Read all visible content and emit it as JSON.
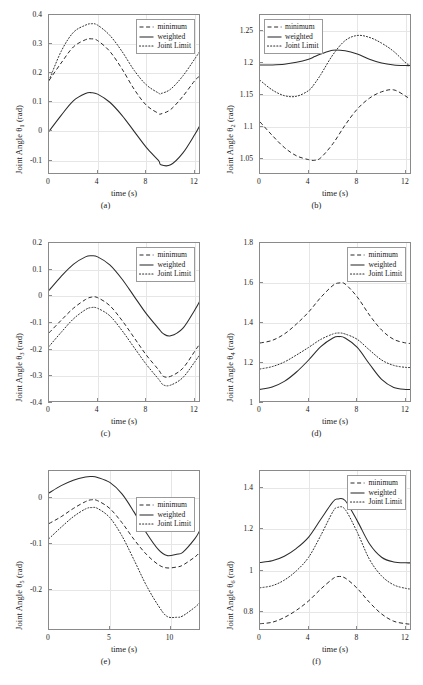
{
  "figure": {
    "series_names": [
      "minimum",
      "weighted",
      "Joint Limit"
    ],
    "xlabel": "time (s)",
    "unit": "(rad)",
    "axis_color": "#8a8a8a",
    "curve_color": "#2b2b2b",
    "grid_color": "#e6e6e6"
  },
  "legend": {
    "minimum": "minimum",
    "weighted": "weighted",
    "joint_limit": "Joint Limit"
  },
  "chart_data": [
    {
      "type": "line",
      "panel": "(a)",
      "title": "",
      "xlabel": "time (s)",
      "ylabel": "Joint Angle θ",
      "ylabel_sub": "1",
      "ylabel_unit": "(rad)",
      "xlim": [
        0,
        12.5
      ],
      "ylim": [
        -0.15,
        0.4
      ],
      "xticks": [
        0,
        4,
        8,
        12
      ],
      "xticklabels": [
        "0",
        "4",
        "8",
        "12"
      ],
      "yticks": [
        0.4,
        0.3,
        0.2,
        0.1,
        0,
        -0.1
      ],
      "yticklabels": [
        "0.4",
        "0.3",
        "0.2",
        "0.1",
        "0",
        "-0.1"
      ],
      "grid": true,
      "legend_position": "upper-right",
      "x": [
        0,
        1,
        2,
        3,
        3.5,
        4,
        5,
        6,
        7,
        8,
        9,
        9.2,
        10,
        11,
        12,
        12.4
      ],
      "series": [
        {
          "name": "minimum",
          "style": "dashed",
          "values": [
            0.175,
            0.235,
            0.29,
            0.315,
            0.318,
            0.312,
            0.275,
            0.215,
            0.145,
            0.09,
            0.062,
            0.06,
            0.075,
            0.12,
            0.175,
            0.19
          ]
        },
        {
          "name": "weighted",
          "style": "solid",
          "values": [
            0.0,
            0.055,
            0.105,
            0.13,
            0.133,
            0.128,
            0.1,
            0.055,
            0.0,
            -0.055,
            -0.1,
            -0.115,
            -0.115,
            -0.075,
            -0.01,
            0.02
          ]
        },
        {
          "name": "Joint Limit",
          "style": "dotted",
          "values": [
            0.175,
            0.275,
            0.34,
            0.365,
            0.37,
            0.365,
            0.33,
            0.275,
            0.21,
            0.16,
            0.132,
            0.13,
            0.145,
            0.19,
            0.25,
            0.275
          ]
        }
      ]
    },
    {
      "type": "line",
      "panel": "(b)",
      "title": "",
      "xlabel": "time (s)",
      "ylabel": "Joint Angle θ",
      "ylabel_sub": "2",
      "ylabel_unit": "(rad)",
      "xlim": [
        0,
        12.5
      ],
      "ylim": [
        1.025,
        1.275
      ],
      "xticks": [
        0,
        4,
        8,
        12
      ],
      "xticklabels": [
        "0",
        "4",
        "8",
        "12"
      ],
      "yticks": [
        1.25,
        1.2,
        1.15,
        1.1,
        1.05
      ],
      "yticklabels": [
        "1.25",
        "1.2",
        "1.15",
        "1.1",
        "1.05"
      ],
      "grid": true,
      "legend_position": "upper-left",
      "x": [
        0,
        1,
        2,
        3,
        4,
        4.5,
        5,
        6,
        7,
        8,
        9,
        10,
        11,
        12,
        12.4
      ],
      "series": [
        {
          "name": "minimum",
          "style": "dashed",
          "values": [
            1.108,
            1.087,
            1.068,
            1.055,
            1.049,
            1.048,
            1.052,
            1.074,
            1.103,
            1.128,
            1.145,
            1.155,
            1.158,
            1.148,
            1.142
          ]
        },
        {
          "name": "weighted",
          "style": "solid",
          "values": [
            1.197,
            1.197,
            1.198,
            1.201,
            1.206,
            1.21,
            1.214,
            1.22,
            1.219,
            1.214,
            1.206,
            1.2,
            1.197,
            1.196,
            1.196
          ]
        },
        {
          "name": "Joint Limit",
          "style": "dotted",
          "values": [
            1.173,
            1.158,
            1.149,
            1.148,
            1.157,
            1.168,
            1.182,
            1.213,
            1.235,
            1.243,
            1.24,
            1.231,
            1.218,
            1.2,
            1.196
          ]
        }
      ]
    },
    {
      "type": "line",
      "panel": "(c)",
      "title": "",
      "xlabel": "time (s)",
      "ylabel": "Joint Angle θ",
      "ylabel_sub": "3",
      "ylabel_unit": "(rad)",
      "xlim": [
        0,
        12.5
      ],
      "ylim": [
        -0.4,
        0.2
      ],
      "xticks": [
        0,
        4,
        8,
        12
      ],
      "xticklabels": [
        "0",
        "4",
        "8",
        "12"
      ],
      "yticks": [
        0.2,
        0.1,
        0,
        -0.1,
        -0.2,
        -0.3,
        -0.4
      ],
      "yticklabels": [
        "0.2",
        "0.1",
        "0",
        "-0.1",
        "-0.2",
        "-0.3",
        "-0.4"
      ],
      "grid": true,
      "legend_position": "upper-right",
      "x": [
        0,
        1,
        2,
        3,
        3.5,
        4,
        5,
        6,
        7,
        8,
        9,
        9.4,
        10,
        11,
        12,
        12.4
      ],
      "series": [
        {
          "name": "minimum",
          "style": "dashed",
          "values": [
            -0.137,
            -0.09,
            -0.045,
            -0.012,
            -0.003,
            -0.005,
            -0.035,
            -0.09,
            -0.155,
            -0.22,
            -0.275,
            -0.3,
            -0.3,
            -0.27,
            -0.205,
            -0.178
          ]
        },
        {
          "name": "weighted",
          "style": "solid",
          "values": [
            0.022,
            0.075,
            0.12,
            0.148,
            0.152,
            0.148,
            0.118,
            0.065,
            0.0,
            -0.065,
            -0.12,
            -0.14,
            -0.148,
            -0.12,
            -0.05,
            -0.018
          ]
        },
        {
          "name": "Joint Limit",
          "style": "dotted",
          "values": [
            -0.188,
            -0.135,
            -0.085,
            -0.05,
            -0.042,
            -0.045,
            -0.073,
            -0.128,
            -0.192,
            -0.255,
            -0.31,
            -0.332,
            -0.333,
            -0.305,
            -0.245,
            -0.218
          ]
        }
      ]
    },
    {
      "type": "line",
      "panel": "(d)",
      "title": "",
      "xlabel": "time (s)",
      "ylabel": "Joint Angle θ",
      "ylabel_sub": "4",
      "ylabel_unit": "(rad)",
      "xlim": [
        0,
        12.5
      ],
      "ylim": [
        1.0,
        1.8
      ],
      "xticks": [
        0,
        4,
        8,
        12
      ],
      "xticklabels": [
        "0",
        "4",
        "8",
        "12"
      ],
      "yticks": [
        1.8,
        1.6,
        1.4,
        1.2,
        1.0
      ],
      "yticklabels": [
        "1.8",
        "1.6",
        "1.4",
        "1.2",
        "1"
      ],
      "grid": true,
      "legend_position": "upper-right",
      "x": [
        0,
        1,
        2,
        3,
        4,
        5,
        6,
        6.5,
        7,
        8,
        9,
        10,
        11,
        12,
        12.4
      ],
      "series": [
        {
          "name": "minimum",
          "style": "dashed",
          "values": [
            1.3,
            1.313,
            1.345,
            1.395,
            1.455,
            1.528,
            1.588,
            1.6,
            1.595,
            1.53,
            1.44,
            1.365,
            1.318,
            1.3,
            1.298
          ]
        },
        {
          "name": "weighted",
          "style": "solid",
          "values": [
            1.068,
            1.08,
            1.108,
            1.155,
            1.215,
            1.282,
            1.325,
            1.332,
            1.325,
            1.278,
            1.195,
            1.118,
            1.078,
            1.068,
            1.068
          ]
        },
        {
          "name": "Joint Limit",
          "style": "dotted",
          "values": [
            1.17,
            1.182,
            1.205,
            1.24,
            1.278,
            1.318,
            1.345,
            1.35,
            1.345,
            1.318,
            1.265,
            1.215,
            1.188,
            1.178,
            1.178
          ]
        }
      ]
    },
    {
      "type": "line",
      "panel": "(e)",
      "title": "",
      "xlabel": "time (s)",
      "ylabel": "Joint Angle θ",
      "ylabel_sub": "5",
      "ylabel_unit": "(rad)",
      "xlim": [
        0,
        12.5
      ],
      "ylim": [
        -0.29,
        0.06
      ],
      "xticks": [
        0,
        5,
        10
      ],
      "xticklabels": [
        "0",
        "5",
        "10"
      ],
      "yticks": [
        0,
        -0.1,
        -0.2
      ],
      "yticklabels": [
        "0",
        "-0.1",
        "-0.2"
      ],
      "grid": true,
      "legend_position": "upper-right",
      "x": [
        0,
        1,
        2,
        3,
        3.5,
        4,
        5,
        6,
        7,
        8,
        9,
        9.7,
        10.5,
        11,
        12,
        12.4
      ],
      "series": [
        {
          "name": "minimum",
          "style": "dashed",
          "values": [
            -0.055,
            -0.04,
            -0.022,
            -0.007,
            -0.003,
            -0.005,
            -0.022,
            -0.053,
            -0.09,
            -0.122,
            -0.145,
            -0.152,
            -0.15,
            -0.146,
            -0.128,
            -0.118
          ]
        },
        {
          "name": "weighted",
          "style": "solid",
          "values": [
            0.012,
            0.028,
            0.04,
            0.047,
            0.048,
            0.046,
            0.035,
            0.01,
            -0.03,
            -0.075,
            -0.112,
            -0.125,
            -0.122,
            -0.118,
            -0.088,
            -0.07
          ]
        },
        {
          "name": "Joint Limit",
          "style": "dotted",
          "values": [
            -0.088,
            -0.063,
            -0.04,
            -0.023,
            -0.02,
            -0.022,
            -0.042,
            -0.082,
            -0.135,
            -0.19,
            -0.235,
            -0.258,
            -0.26,
            -0.257,
            -0.238,
            -0.228
          ]
        }
      ]
    },
    {
      "type": "line",
      "panel": "(f)",
      "title": "",
      "xlabel": "time (s)",
      "ylabel": "Joint Angle θ",
      "ylabel_sub": "6",
      "ylabel_unit": "(rad)",
      "xlim": [
        0,
        12.5
      ],
      "ylim": [
        0.71,
        1.48
      ],
      "xticks": [
        0,
        4,
        8,
        12
      ],
      "xticklabels": [
        "0",
        "4",
        "8",
        "12"
      ],
      "yticks": [
        1.4,
        1.2,
        1.0,
        0.8
      ],
      "yticklabels": [
        "1.4",
        "1.2",
        "1",
        "0.8"
      ],
      "grid": true,
      "legend_position": "upper-right",
      "x": [
        0,
        1,
        2,
        3,
        4,
        5,
        6,
        6.4,
        7,
        8,
        9,
        10,
        11,
        12,
        12.4
      ],
      "series": [
        {
          "name": "minimum",
          "style": "dashed",
          "values": [
            0.745,
            0.752,
            0.775,
            0.81,
            0.855,
            0.912,
            0.962,
            0.972,
            0.965,
            0.915,
            0.848,
            0.792,
            0.757,
            0.745,
            0.743
          ]
        },
        {
          "name": "weighted",
          "style": "solid",
          "values": [
            1.04,
            1.048,
            1.07,
            1.108,
            1.162,
            1.248,
            1.332,
            1.345,
            1.338,
            1.24,
            1.13,
            1.065,
            1.042,
            1.038,
            1.038
          ]
        },
        {
          "name": "Joint Limit",
          "style": "dotted",
          "values": [
            0.918,
            0.928,
            0.955,
            1.0,
            1.065,
            1.17,
            1.285,
            1.305,
            1.295,
            1.185,
            1.055,
            0.975,
            0.932,
            0.915,
            0.912
          ]
        }
      ]
    }
  ]
}
